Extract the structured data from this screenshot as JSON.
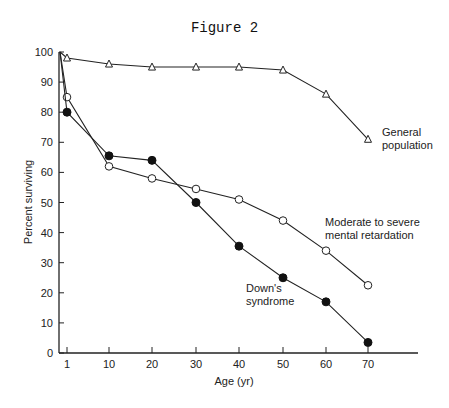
{
  "chart_data": {
    "type": "line",
    "title": "Figure 2",
    "xlabel": "Age (yr)",
    "ylabel": "Percent surviving",
    "x": [
      1,
      10,
      20,
      30,
      40,
      50,
      60,
      70
    ],
    "x_ticks": [
      "1",
      "10",
      "20",
      "30",
      "40",
      "50",
      "60",
      "70"
    ],
    "y_ticks": [
      "0",
      "10",
      "20",
      "30",
      "40",
      "50",
      "60",
      "70",
      "80",
      "90",
      "100"
    ],
    "ylim": [
      0,
      100
    ],
    "grid": false,
    "legend": "inline labels",
    "series": [
      {
        "name": "General population",
        "marker": "open-triangle",
        "values": [
          98,
          96,
          95,
          95,
          95,
          94,
          86,
          71
        ]
      },
      {
        "name": "Moderate to severe mental retardation",
        "marker": "open-circle",
        "values": [
          85,
          62,
          58,
          54.5,
          51,
          44,
          34,
          22.5
        ]
      },
      {
        "name": "Down's syndrome",
        "marker": "filled-circle",
        "values": [
          80,
          65.5,
          64,
          50,
          35.5,
          25,
          17,
          3.5
        ]
      }
    ],
    "labels": {
      "general": [
        "General",
        "population"
      ],
      "mr": [
        "Moderate to severe",
        "mental retardation"
      ],
      "down": [
        "Down's",
        "syndrome"
      ]
    }
  }
}
